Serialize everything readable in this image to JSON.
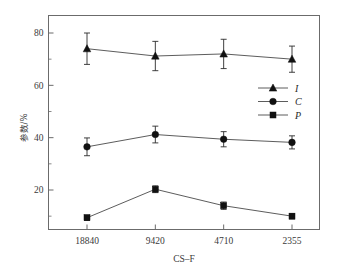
{
  "chart_data": {
    "type": "line",
    "title": "",
    "xlabel": "CS–F",
    "ylabel": "参数/%",
    "categories": [
      "18840",
      "9420",
      "4710",
      "2355"
    ],
    "ylim": [
      0,
      88
    ],
    "yticks": [
      20,
      40,
      60,
      80
    ],
    "ytick_labels": [
      "20",
      "40",
      "60",
      "80"
    ],
    "minor_ticks": true,
    "grid": false,
    "legend_position": "right-upper",
    "series": [
      {
        "name": "I",
        "marker": "triangle",
        "values": [
          74.0,
          71.2,
          72.0,
          70.0
        ],
        "errors": [
          6.0,
          5.6,
          5.6,
          5.0
        ]
      },
      {
        "name": "C",
        "marker": "circle",
        "values": [
          36.5,
          41.2,
          39.4,
          38.2
        ],
        "errors": [
          3.4,
          3.2,
          2.9,
          2.5
        ]
      },
      {
        "name": "P",
        "marker": "square",
        "values": [
          9.4,
          20.3,
          14.0,
          10.0
        ],
        "errors": [
          1.0,
          1.3,
          1.4,
          1.0
        ]
      }
    ]
  },
  "axes": {
    "x_title": "CS–F",
    "y_title": "参数/%",
    "x_tick_labels": [
      "18840",
      "9420",
      "4710",
      "2355"
    ],
    "y_tick_labels": [
      "20",
      "40",
      "60",
      "80"
    ]
  },
  "legend": {
    "entries": [
      {
        "label": "I",
        "marker": "triangle"
      },
      {
        "label": "C",
        "marker": "circle"
      },
      {
        "label": "P",
        "marker": "square"
      }
    ]
  },
  "colors": {
    "line": "#4a4a4a",
    "marker": "#111111",
    "axis": "#6b6b6b",
    "text": "#3a3a3a",
    "background": "#ffffff"
  }
}
